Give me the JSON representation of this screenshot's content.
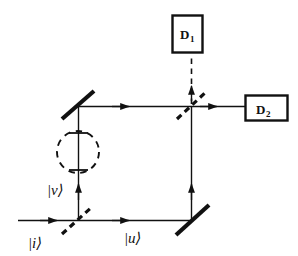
{
  "figure": {
    "kind": "mach-zehnder-interferometer-diagram",
    "background_color": "#ffffff",
    "ink_color": "#111111"
  },
  "detectors": [
    {
      "id": "D1",
      "label_main": "D",
      "label_sub": "1",
      "box": {
        "x": 172,
        "y": 15,
        "w": 31,
        "h": 38
      },
      "icon": "detector-box-icon"
    },
    {
      "id": "D2",
      "label_main": "D",
      "label_sub": "2",
      "box": {
        "x": 245,
        "y": 95,
        "w": 43,
        "h": 26
      },
      "icon": "detector-box-icon"
    }
  ],
  "beam_splitters": [
    {
      "id": "bs-input",
      "name": "input-beam-splitter",
      "style": "dashed-diagonal",
      "x1": 62,
      "y1": 234,
      "x2": 93,
      "y2": 206
    },
    {
      "id": "bs-output",
      "name": "output-beam-splitter",
      "style": "dashed-diagonal",
      "x1": 177,
      "y1": 119,
      "x2": 206,
      "y2": 92
    }
  ],
  "mirrors": [
    {
      "id": "mirror-upper-left",
      "name": "upper-left-mirror",
      "style": "solid-thick-diagonal",
      "x1": 62,
      "y1": 119,
      "x2": 94,
      "y2": 91
    },
    {
      "id": "mirror-lower-right",
      "name": "lower-right-mirror",
      "style": "solid-thick-diagonal",
      "x1": 176,
      "y1": 235,
      "x2": 209,
      "y2": 205
    }
  ],
  "object_marker": {
    "name": "dashed-circle-object",
    "cx": 78,
    "cy": 152,
    "r": 21,
    "style": "dashed-circle",
    "ticks": [
      {
        "y": 133,
        "x1": 69,
        "x2": 87
      },
      {
        "y": 170,
        "x1": 69,
        "x2": 87
      }
    ]
  },
  "paths": {
    "input_beam": {
      "x1": 18,
      "y1": 220,
      "x2": 78,
      "y2": 220,
      "arrow_at": 56
    },
    "lower_arm": {
      "x1": 78,
      "y1": 220,
      "x2": 191,
      "y2": 220,
      "arrow_at": 128
    },
    "upper_left_vertical": {
      "x1": 78,
      "y1": 220,
      "x2": 78,
      "y2": 107,
      "arrow_at": 186
    },
    "upper_arm": {
      "x1": 78,
      "y1": 107,
      "x2": 191,
      "y2": 107,
      "arrow_at": 128
    },
    "right_vertical": {
      "x1": 191,
      "y1": 220,
      "x2": 191,
      "y2": 107,
      "arrow_at": 186
    },
    "to_d1": {
      "x1": 191,
      "y1": 107,
      "x2": 191,
      "y2": 55,
      "style": "dashed",
      "arrow_at": 88
    },
    "to_d2": {
      "x1": 191,
      "y1": 107,
      "x2": 245,
      "y2": 107,
      "arrow_at": 218
    }
  },
  "state_labels": [
    {
      "id": "ket-v",
      "text": "|v⟩",
      "bar": "|",
      "letter": "v",
      "ket": "⟩",
      "x": 47,
      "y": 193
    },
    {
      "id": "ket-i",
      "text": "|i⟩",
      "bar": "|",
      "letter": "i",
      "ket": "⟩",
      "x": 28,
      "y": 247
    },
    {
      "id": "ket-u",
      "text": "|u⟩",
      "bar": "|",
      "letter": "u",
      "ket": "⟩",
      "x": 124,
      "y": 242
    }
  ]
}
